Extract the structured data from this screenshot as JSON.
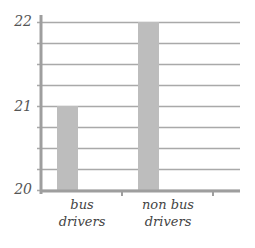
{
  "chart_data": {
    "type": "bar",
    "title": "",
    "xlabel": "",
    "ylabel": "",
    "categories": [
      "bus drivers",
      "non bus drivers"
    ],
    "category_lines": [
      [
        "bus",
        "drivers"
      ],
      [
        "non bus",
        "drivers"
      ]
    ],
    "values": [
      21,
      22
    ],
    "ylim": [
      20,
      22
    ],
    "yticks": [
      20,
      21,
      22
    ],
    "ytick_labels": [
      "20",
      "21",
      "22"
    ],
    "minor_gridlines_per_major": 4,
    "grid": true,
    "legend": null,
    "bar_color": "#bdbdbd",
    "grid_color": "#a9a9a9"
  }
}
